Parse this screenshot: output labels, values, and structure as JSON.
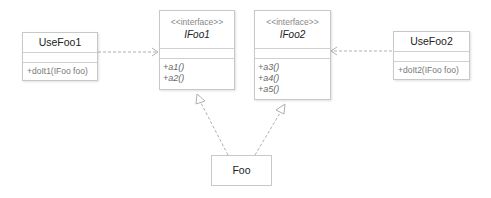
{
  "classes": {
    "usefoo1": {
      "name": "UseFoo1",
      "methods": [
        "+doIt1(IFoo foo)"
      ]
    },
    "ifoo1": {
      "stereotype": "<<interface>>",
      "name": "IFoo1",
      "methods": [
        "+a1()",
        "+a2()"
      ]
    },
    "ifoo2": {
      "stereotype": "<<interface>>",
      "name": "IFoo2",
      "methods": [
        "+a3()",
        "+a4()",
        "+a5()"
      ]
    },
    "usefoo2": {
      "name": "UseFoo2",
      "methods": [
        "+doIt2(IFoo foo)"
      ]
    },
    "foo": {
      "name": "Foo"
    }
  },
  "relations": [
    {
      "from": "UseFoo1",
      "to": "IFoo1",
      "type": "dependency"
    },
    {
      "from": "UseFoo2",
      "to": "IFoo2",
      "type": "dependency"
    },
    {
      "from": "Foo",
      "to": "IFoo1",
      "type": "realization"
    },
    {
      "from": "Foo",
      "to": "IFoo2",
      "type": "realization"
    }
  ],
  "colors": {
    "line": "#b0b0b0",
    "border": "#c8c8c8"
  }
}
